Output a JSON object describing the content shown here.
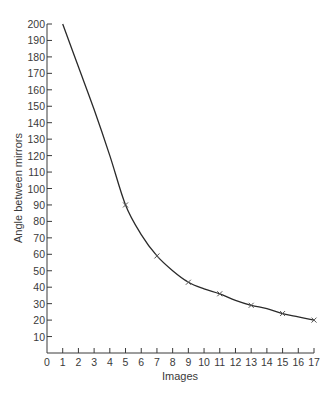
{
  "chart_data": {
    "type": "line",
    "title": "",
    "xlabel": "Images",
    "ylabel": "Angle between mirrors",
    "xlim": [
      0,
      17
    ],
    "ylim": [
      0,
      200
    ],
    "x_ticks": [
      0,
      1,
      2,
      3,
      4,
      5,
      6,
      7,
      8,
      9,
      10,
      11,
      12,
      13,
      14,
      15,
      16,
      17
    ],
    "y_ticks": [
      10,
      20,
      30,
      40,
      50,
      60,
      70,
      80,
      90,
      100,
      110,
      120,
      130,
      140,
      150,
      160,
      170,
      180,
      190,
      200
    ],
    "grid": false,
    "legend": null,
    "series": [
      {
        "name": "Angle vs images",
        "curve": {
          "x": [
            1,
            2,
            3,
            4,
            5,
            6,
            7,
            8,
            9,
            10,
            11,
            12,
            13,
            14,
            15,
            16,
            17
          ],
          "y": [
            200,
            174,
            148,
            120,
            90,
            72,
            59,
            50,
            43,
            39,
            36,
            32,
            29,
            27,
            24,
            22,
            20
          ]
        },
        "marked_points": {
          "x": [
            5,
            7,
            9,
            11,
            13,
            15,
            17
          ],
          "y": [
            90,
            59,
            43,
            36,
            29,
            24,
            20
          ]
        },
        "marker": "x",
        "color": "#2a2a2a"
      }
    ]
  },
  "axes": {
    "xlabel": "Images",
    "ylabel": "Angle between mirrors"
  }
}
